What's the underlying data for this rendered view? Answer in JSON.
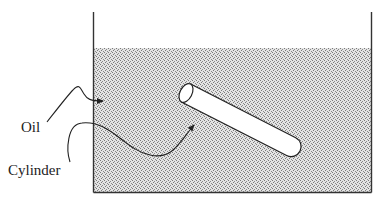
{
  "diagram": {
    "type": "physics-illustration",
    "labels": {
      "oil": "Oil",
      "cylinder": "Cylinder"
    },
    "colors": {
      "outline": "#222222",
      "oil_fill_base": "#e2e2e2",
      "oil_dots": "#777777",
      "cylinder_fill": "#ffffff"
    }
  }
}
